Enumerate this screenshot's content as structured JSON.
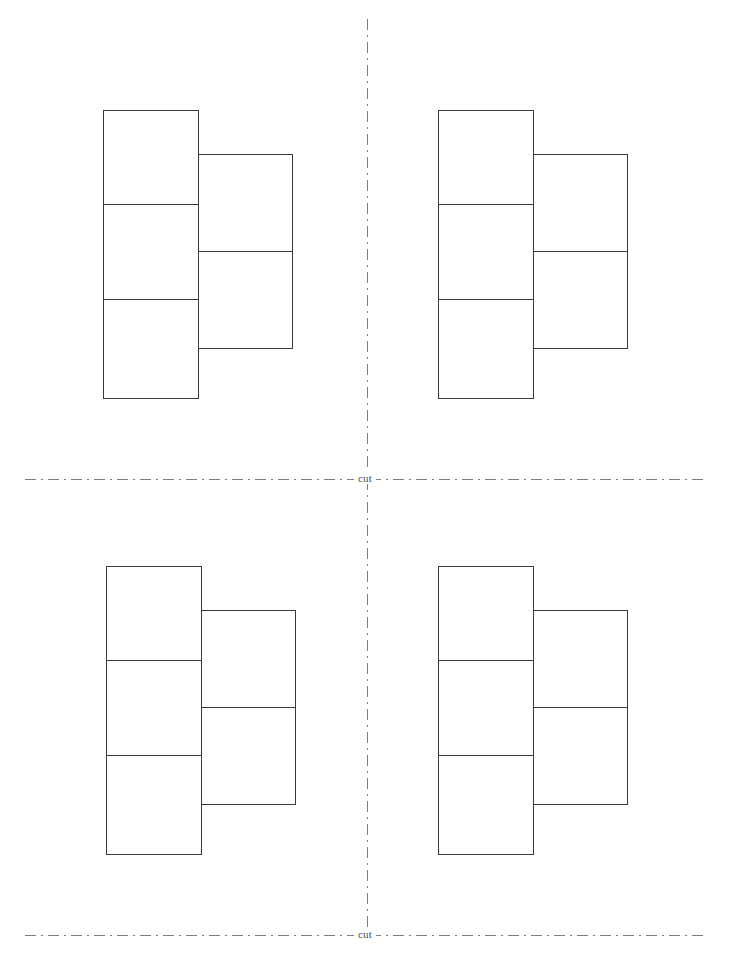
{
  "page": {
    "width": 730,
    "height": 970,
    "background_color": "#ffffff",
    "stroke_color": "#3a3a3a",
    "guide_color": "#7d7d7d"
  },
  "guides": {
    "horizontal": [
      {
        "id": "cut-line-middle",
        "label": "cut",
        "y": 479,
        "x_start": 25,
        "x_end": 703,
        "label_x": 367
      },
      {
        "id": "cut-line-bottom",
        "label": "cut",
        "y": 935,
        "x_start": 25,
        "x_end": 703,
        "label_x": 367
      }
    ],
    "vertical": [
      {
        "id": "cut-line-center",
        "x": 367,
        "y_start": 19,
        "y_end": 933
      }
    ],
    "label_text": "cut"
  },
  "figures": [
    {
      "id": "figure-top-left",
      "name": "net-top-left",
      "left_column": {
        "x": 103,
        "y": 110,
        "width": 96,
        "cells": [
          95,
          95,
          99
        ]
      },
      "right_column": {
        "x": 198,
        "y": 154,
        "width": 95,
        "cells": [
          98,
          97
        ]
      }
    },
    {
      "id": "figure-top-right",
      "name": "net-top-right",
      "left_column": {
        "x": 438,
        "y": 110,
        "width": 96,
        "cells": [
          95,
          95,
          99
        ]
      },
      "right_column": {
        "x": 533,
        "y": 154,
        "width": 95,
        "cells": [
          98,
          97
        ]
      }
    },
    {
      "id": "figure-bottom-left",
      "name": "net-bottom-left",
      "left_column": {
        "x": 106,
        "y": 566,
        "width": 96,
        "cells": [
          95,
          95,
          99
        ]
      },
      "right_column": {
        "x": 201,
        "y": 610,
        "width": 95,
        "cells": [
          98,
          97
        ]
      }
    },
    {
      "id": "figure-bottom-right",
      "name": "net-bottom-right",
      "left_column": {
        "x": 438,
        "y": 566,
        "width": 96,
        "cells": [
          95,
          95,
          99
        ]
      },
      "right_column": {
        "x": 533,
        "y": 610,
        "width": 95,
        "cells": [
          98,
          97
        ]
      }
    }
  ]
}
